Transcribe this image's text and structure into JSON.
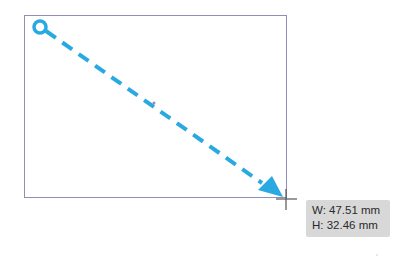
{
  "drawing": {
    "frame": {
      "x": 24,
      "y": 15,
      "width": 263,
      "height": 183,
      "stroke": "#8e8fb4"
    },
    "drag_line": {
      "start": {
        "x": 40,
        "y": 27
      },
      "end": {
        "x": 285,
        "y": 199
      },
      "color": "#29a9e1",
      "style": "dashed"
    },
    "start_handle": "circle-handle-icon",
    "end_marker": "arrowhead-icon",
    "cursor": "crosshair-cursor-icon",
    "center_point": {
      "x": 154,
      "y": 103
    }
  },
  "tooltip": {
    "width_label": "W: 47.51 mm",
    "height_label": "H: 32.46 mm"
  }
}
